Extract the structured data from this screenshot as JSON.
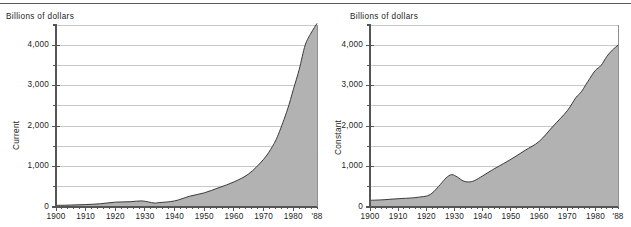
{
  "figure": {
    "top_rule": true,
    "panels": [
      "current",
      "constant"
    ]
  },
  "chart_data": [
    {
      "type": "area",
      "id": "current",
      "title": "",
      "unit_label": "Billions of dollars",
      "ylabel": "Current",
      "xlabel": "",
      "ylim": [
        0,
        4500
      ],
      "xlim": [
        1900,
        1988
      ],
      "grid": true,
      "grid_step": 500,
      "legend": "none",
      "ytick_labels": [
        "0",
        "1,000",
        "2,000",
        "3,000",
        "4,000"
      ],
      "ytick_values": [
        0,
        1000,
        2000,
        3000,
        4000
      ],
      "yminor_values": [
        500,
        1500,
        2500,
        3500,
        4500
      ],
      "xtick_labels": [
        "1900",
        "1910",
        "1920",
        "1930",
        "1940",
        "1950",
        "1960",
        "1970",
        "1980",
        "'88"
      ],
      "xtick_values": [
        1900,
        1910,
        1920,
        1930,
        1940,
        1950,
        1960,
        1970,
        1980,
        1988
      ],
      "x": [
        1900,
        1905,
        1910,
        1915,
        1920,
        1925,
        1929,
        1933,
        1935,
        1940,
        1945,
        1950,
        1955,
        1960,
        1965,
        1970,
        1973,
        1975,
        1978,
        1980,
        1982,
        1984,
        1986,
        1988
      ],
      "values": [
        40,
        48,
        60,
        80,
        120,
        130,
        150,
        100,
        110,
        150,
        265,
        350,
        480,
        620,
        820,
        1180,
        1500,
        1800,
        2400,
        2900,
        3400,
        4000,
        4300,
        4540
      ],
      "fill_color": "#b2b2b2",
      "line_color": "#3a3a3a"
    },
    {
      "type": "area",
      "id": "constant",
      "title": "",
      "unit_label": "Billions of dollars",
      "ylabel": "Constant",
      "xlabel": "",
      "ylim": [
        0,
        4500
      ],
      "xlim": [
        1900,
        1988
      ],
      "grid": true,
      "grid_step": 500,
      "legend": "none",
      "ytick_labels": [
        "0",
        "1,000",
        "2,000",
        "3,000",
        "4,000"
      ],
      "ytick_values": [
        0,
        1000,
        2000,
        3000,
        4000
      ],
      "yminor_values": [
        500,
        1500,
        2500,
        3500,
        4500
      ],
      "xtick_labels": [
        "1900",
        "1910",
        "1920",
        "1930",
        "1940",
        "1950",
        "1960",
        "1970",
        "1980",
        "'88"
      ],
      "xtick_values": [
        1900,
        1910,
        1920,
        1930,
        1940,
        1950,
        1960,
        1970,
        1980,
        1988
      ],
      "x": [
        1900,
        1905,
        1910,
        1915,
        1918,
        1920,
        1922,
        1925,
        1927,
        1929,
        1931,
        1933,
        1935,
        1937,
        1940,
        1943,
        1945,
        1950,
        1955,
        1960,
        1965,
        1970,
        1973,
        1975,
        1978,
        1980,
        1982,
        1984,
        1986,
        1988
      ],
      "values": [
        165,
        180,
        205,
        225,
        250,
        270,
        340,
        560,
        720,
        800,
        740,
        645,
        620,
        650,
        770,
        900,
        980,
        1180,
        1400,
        1620,
        2000,
        2380,
        2700,
        2850,
        3180,
        3380,
        3500,
        3720,
        3880,
        4000
      ],
      "fill_color": "#b2b2b2",
      "line_color": "#3a3a3a"
    }
  ]
}
